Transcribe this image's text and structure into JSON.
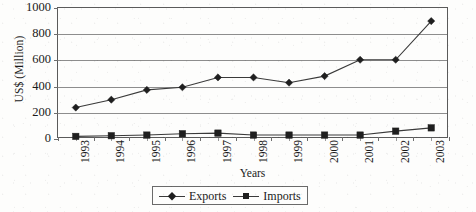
{
  "chart_data": {
    "type": "line",
    "title": "",
    "xlabel": "Years",
    "ylabel": "US$ (Million)",
    "categories": [
      "1993",
      "1994",
      "1995",
      "1996",
      "1997",
      "1998",
      "1999",
      "2000",
      "2001",
      "2002",
      "2003"
    ],
    "series": [
      {
        "name": "Exports",
        "marker": "diamond",
        "values": [
          240,
          300,
          375,
          395,
          470,
          470,
          430,
          480,
          605,
          605,
          900
        ]
      },
      {
        "name": "Imports",
        "marker": "square",
        "values": [
          20,
          25,
          30,
          40,
          45,
          30,
          30,
          30,
          30,
          60,
          85
        ]
      }
    ],
    "ylim": [
      0,
      1000
    ],
    "yticks": [
      0,
      200,
      400,
      600,
      800,
      1000
    ],
    "ytick_labels": [
      "0",
      "200",
      "400",
      "600",
      "800",
      "1000"
    ],
    "grid": true,
    "legend_position": "bottom-center",
    "legend_entries": [
      "Exports",
      "Imports"
    ],
    "colors": {
      "line": "#3a3a3a",
      "marker": "#1f1f1f",
      "grid": "#8d8d8d",
      "frame": "#5a5a5a",
      "background": "#fdfdfc",
      "text": "#1a1a1a"
    }
  }
}
